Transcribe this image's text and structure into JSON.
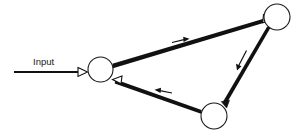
{
  "diagram": {
    "type": "directed-cycle-graph",
    "title": "",
    "background_color": "#ffffff",
    "stroke_color": "#111111",
    "labels": {
      "input": "Input"
    },
    "nodes": [
      {
        "id": "n1",
        "name": "left-node",
        "label": "",
        "cx": 100.5,
        "cy": 69.5,
        "r": 12.5
      },
      {
        "id": "n2",
        "name": "top-right-node",
        "label": "",
        "cx": 277.0,
        "cy": 17.0,
        "r": 13.0
      },
      {
        "id": "n3",
        "name": "bottom-node",
        "label": "",
        "cx": 214.0,
        "cy": 116.0,
        "r": 13.0
      }
    ],
    "edges": [
      {
        "id": "e0",
        "name": "input-edge",
        "from": "input",
        "to": "n1",
        "arrowhead": "open",
        "direction_marker": "none"
      },
      {
        "id": "e1",
        "name": "edge-left-to-topright",
        "from": "n1",
        "to": "n2",
        "arrowhead": "open",
        "direction_marker": "right"
      },
      {
        "id": "e2",
        "name": "edge-topright-to-bottom",
        "from": "n2",
        "to": "n3",
        "arrowhead": "filled",
        "direction_marker": "down-left"
      },
      {
        "id": "e3",
        "name": "edge-bottom-to-left",
        "from": "n3",
        "to": "n1",
        "arrowhead": "open",
        "direction_marker": "left"
      }
    ]
  }
}
